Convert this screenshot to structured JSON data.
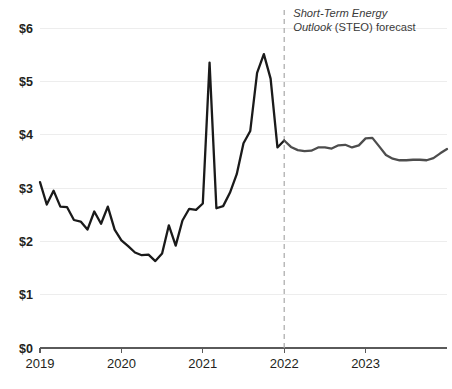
{
  "chart_data": {
    "type": "line",
    "title": "",
    "subtitle": "",
    "xlabel": "",
    "ylabel": "",
    "grid": true,
    "legend_position": "none",
    "ylim": [
      0,
      6
    ],
    "xlim": [
      2019.0,
      2024.0
    ],
    "ytick_labels": [
      "$0",
      "$1",
      "$2",
      "$3",
      "$4",
      "$5",
      "$6"
    ],
    "ytick_values": [
      0,
      1,
      2,
      3,
      4,
      5,
      6
    ],
    "xtick_labels": [
      "2019",
      "2020",
      "2021",
      "2022",
      "2023"
    ],
    "xtick_values": [
      2019,
      2020,
      2021,
      2022,
      2023
    ],
    "annotations": [
      {
        "name": "forecast-annotation",
        "line1_italic": "Short-Term Energy",
        "line2_italic": "Outlook",
        "line2_roman": "(STEO) forecast",
        "x": 2022.0
      }
    ],
    "forecast_divider_x": 2022.0,
    "series": [
      {
        "name": "Historical",
        "color": "#1a1a1a",
        "x": [
          2019.0,
          2019.083,
          2019.167,
          2019.25,
          2019.333,
          2019.417,
          2019.5,
          2019.583,
          2019.667,
          2019.75,
          2019.833,
          2019.917,
          2020.0,
          2020.083,
          2020.167,
          2020.25,
          2020.333,
          2020.417,
          2020.5,
          2020.583,
          2020.667,
          2020.75,
          2020.833,
          2020.917,
          2021.0,
          2021.083,
          2021.167,
          2021.25,
          2021.333,
          2021.417,
          2021.5,
          2021.583,
          2021.667,
          2021.75,
          2021.833,
          2021.917,
          2022.0
        ],
        "values": [
          3.11,
          2.69,
          2.95,
          2.65,
          2.64,
          2.4,
          2.37,
          2.22,
          2.56,
          2.33,
          2.65,
          2.22,
          2.02,
          1.91,
          1.79,
          1.74,
          1.75,
          1.63,
          1.77,
          2.3,
          1.92,
          2.39,
          2.61,
          2.59,
          2.71,
          5.35,
          2.62,
          2.66,
          2.91,
          3.26,
          3.84,
          4.07,
          5.16,
          5.51,
          5.05,
          3.76,
          3.89
        ]
      },
      {
        "name": "STEO forecast",
        "color": "#4d4d4d",
        "x": [
          2022.0,
          2022.083,
          2022.167,
          2022.25,
          2022.333,
          2022.417,
          2022.5,
          2022.583,
          2022.667,
          2022.75,
          2022.833,
          2022.917,
          2023.0,
          2023.083,
          2023.167,
          2023.25,
          2023.333,
          2023.417,
          2023.5,
          2023.583,
          2023.667,
          2023.75,
          2023.833,
          2023.917,
          2024.0
        ],
        "values": [
          3.89,
          3.77,
          3.71,
          3.69,
          3.7,
          3.76,
          3.76,
          3.74,
          3.8,
          3.81,
          3.76,
          3.8,
          3.93,
          3.94,
          3.78,
          3.62,
          3.55,
          3.52,
          3.52,
          3.53,
          3.53,
          3.52,
          3.56,
          3.65,
          3.73
        ]
      }
    ]
  },
  "layout": {
    "plot_left": 40,
    "plot_right": 447,
    "plot_top": 28,
    "plot_bottom": 348
  }
}
